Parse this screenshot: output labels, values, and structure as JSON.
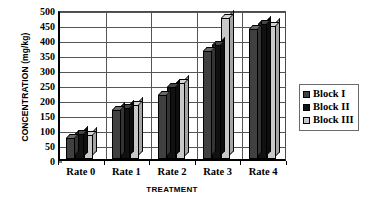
{
  "chart_data": {
    "type": "bar",
    "title": "",
    "xlabel": "TREATMENT",
    "ylabel": "CONCENTRATION (mg/kg)",
    "categories": [
      "Rate 0",
      "Rate 1",
      "Rate 2",
      "Rate 3",
      "Rate 4"
    ],
    "series": [
      {
        "name": "Block I",
        "color": "#404040",
        "values": [
          70,
          165,
          215,
          360,
          435
        ]
      },
      {
        "name": "Block II",
        "color": "#111111",
        "values": [
          85,
          170,
          240,
          380,
          450
        ]
      },
      {
        "name": "Block III",
        "color": "#c8c8c8",
        "values": [
          80,
          180,
          255,
          470,
          445
        ]
      }
    ],
    "ylim": [
      0,
      500
    ],
    "ytick_step": 50,
    "yticks": [
      "0",
      "50",
      "100",
      "150",
      "200",
      "250",
      "300",
      "350",
      "400",
      "450",
      "500"
    ],
    "grid": true,
    "legend_position": "right",
    "style": "3d-clustered-column"
  },
  "legend": {
    "items": [
      {
        "label": "Block I"
      },
      {
        "label": "Block II"
      },
      {
        "label": "Block III"
      }
    ]
  },
  "axes": {
    "y_title": "CONCENTRATION (mg/kg)",
    "x_title": "TREATMENT"
  }
}
